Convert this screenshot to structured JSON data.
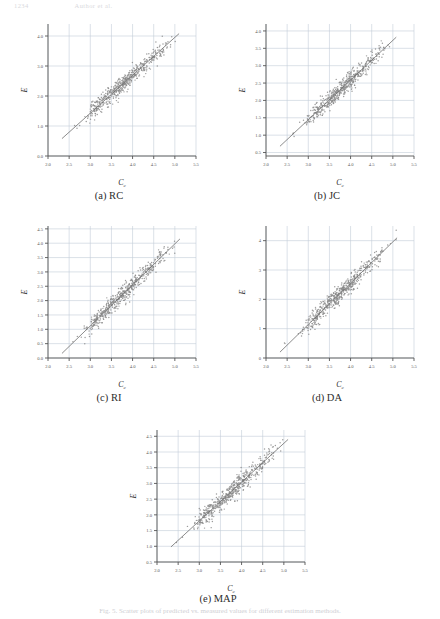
{
  "header": {
    "left": "1234",
    "right": "Author et al."
  },
  "figure": {
    "caption": "Fig. 5.  Scatter plots of predicted vs. measured values for different estimation methods.",
    "axis_labels": {
      "x_main": "C",
      "x_sub": "c",
      "y": "E"
    }
  },
  "panels": [
    {
      "id": "a",
      "caption": "(a) RC",
      "chart_data": {
        "type": "scatter",
        "title": "(a) RC",
        "xlabel": "C_c",
        "ylabel": "E",
        "xlim": [
          2.0,
          5.5
        ],
        "ylim": [
          0.0,
          4.4
        ],
        "xticks": [
          "2.0",
          "2.5",
          "3.0",
          "3.5",
          "4.0",
          "4.5",
          "5.0",
          "5.5"
        ],
        "yticks": [
          "0.0",
          "1.0",
          "2.0",
          "3.0",
          "4.0"
        ],
        "grid": true,
        "legend": "none",
        "fit_line": {
          "x": [
            2.33,
            5.1
          ],
          "y": [
            0.58,
            4.08
          ]
        },
        "points_count": 520,
        "point_color": "#8a8a8a",
        "line_color": "#6f6f6f",
        "grid_color": "#c3ccd8"
      }
    },
    {
      "id": "b",
      "caption": "(b) JC",
      "chart_data": {
        "type": "scatter",
        "title": "(b) JC",
        "xlabel": "C_c",
        "ylabel": "E",
        "xlim": [
          2.0,
          5.5
        ],
        "ylim": [
          0.4,
          4.2
        ],
        "xticks": [
          "2.0",
          "2.5",
          "3.0",
          "3.5",
          "4.0",
          "4.5",
          "5.0",
          "5.5"
        ],
        "yticks": [
          "0.5",
          "1.0",
          "1.5",
          "2.0",
          "2.5",
          "3.0",
          "3.5",
          "4.0"
        ],
        "grid": true,
        "legend": "none",
        "fit_line": {
          "x": [
            2.33,
            5.08
          ],
          "y": [
            0.68,
            3.82
          ]
        },
        "points_count": 520,
        "point_color": "#8a8a8a",
        "line_color": "#6f6f6f",
        "grid_color": "#c3ccd8"
      }
    },
    {
      "id": "c",
      "caption": "(c) RI",
      "chart_data": {
        "type": "scatter",
        "title": "(c) RI",
        "xlabel": "C_c",
        "ylabel": "E",
        "xlim": [
          2.0,
          5.5
        ],
        "ylim": [
          0.0,
          4.6
        ],
        "xticks": [
          "2.0",
          "2.5",
          "3.0",
          "3.5",
          "4.0",
          "4.5",
          "5.0",
          "5.5"
        ],
        "yticks": [
          "0.0",
          "0.5",
          "1.0",
          "1.5",
          "2.0",
          "2.5",
          "3.0",
          "3.5",
          "4.0",
          "4.5"
        ],
        "grid": true,
        "legend": "none",
        "fit_line": {
          "x": [
            2.33,
            5.12
          ],
          "y": [
            0.16,
            4.15
          ]
        },
        "points_count": 520,
        "point_color": "#8a8a8a",
        "line_color": "#6f6f6f",
        "grid_color": "#c3ccd8"
      }
    },
    {
      "id": "d",
      "caption": "(d) DA",
      "chart_data": {
        "type": "scatter",
        "title": "(d) DA",
        "xlabel": "C_c",
        "ylabel": "E",
        "xlim": [
          2.0,
          5.5
        ],
        "ylim": [
          0.0,
          4.5
        ],
        "xticks": [
          "2.0",
          "2.5",
          "3.0",
          "3.5",
          "4.0",
          "4.5",
          "5.0",
          "5.5"
        ],
        "yticks": [
          "0",
          "1",
          "2",
          "3",
          "4"
        ],
        "grid": true,
        "legend": "none",
        "fit_line": {
          "x": [
            2.33,
            5.1
          ],
          "y": [
            0.2,
            4.1
          ]
        },
        "points_count": 520,
        "point_color": "#8a8a8a",
        "line_color": "#6f6f6f",
        "grid_color": "#c3ccd8"
      }
    },
    {
      "id": "e",
      "caption": "(e) MAP",
      "chart_data": {
        "type": "scatter",
        "title": "(e) MAP",
        "xlabel": "C_c",
        "ylabel": "E",
        "xlim": [
          2.0,
          5.5
        ],
        "ylim": [
          0.5,
          4.7
        ],
        "xticks": [
          "2.0",
          "2.5",
          "3.0",
          "3.5",
          "4.0",
          "4.5",
          "5.0",
          "5.5"
        ],
        "yticks": [
          "0.5",
          "1.0",
          "1.5",
          "2.0",
          "2.5",
          "3.0",
          "3.5",
          "4.0",
          "4.5"
        ],
        "grid": true,
        "legend": "none",
        "fit_line": {
          "x": [
            2.33,
            5.1
          ],
          "y": [
            0.98,
            4.4
          ]
        },
        "points_count": 520,
        "point_color": "#8a8a8a",
        "line_color": "#6f6f6f",
        "grid_color": "#c3ccd8"
      }
    }
  ]
}
